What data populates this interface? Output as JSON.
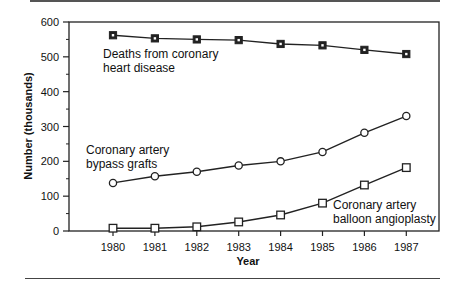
{
  "chart_data": {
    "type": "line",
    "title": "",
    "xlabel": "Year",
    "ylabel": "Number (thousands)",
    "ylim": [
      0,
      600
    ],
    "yticks": [
      0,
      100,
      200,
      300,
      400,
      500,
      600
    ],
    "x": [
      1980,
      1981,
      1982,
      1983,
      1984,
      1985,
      1986,
      1987
    ],
    "grid": false,
    "legend_position": "inline annotations",
    "series": [
      {
        "name": "Deaths from coronary heart disease",
        "marker": "filled-square",
        "values": [
          562,
          553,
          550,
          548,
          537,
          533,
          520,
          508
        ]
      },
      {
        "name": "Coronary artery bypass grafts",
        "marker": "open-circle",
        "values": [
          138,
          157,
          170,
          188,
          200,
          227,
          282,
          330
        ]
      },
      {
        "name": "Coronary artery balloon angioplasty",
        "marker": "open-square",
        "values": [
          8,
          8,
          12,
          26,
          46,
          80,
          132,
          182
        ]
      }
    ],
    "annotations": [
      {
        "lines": [
          "Deaths from coronary",
          "heart disease"
        ]
      },
      {
        "lines": [
          "Coronary artery",
          "bypass grafts"
        ]
      },
      {
        "lines": [
          "Coronary artery",
          "balloon angioplasty"
        ]
      }
    ]
  },
  "axes": {
    "x_title": "Year",
    "y_title": "Number (thousands)",
    "x_ticks": [
      "1980",
      "1981",
      "1982",
      "1983",
      "1984",
      "1985",
      "1986",
      "1987"
    ],
    "y_ticks": [
      "0",
      "100",
      "200",
      "300",
      "400",
      "500",
      "600"
    ]
  },
  "labels": {
    "deaths_line1": "Deaths from coronary",
    "deaths_line2": "heart disease",
    "bypass_line1": "Coronary artery",
    "bypass_line2": "bypass grafts",
    "balloon_line1": "Coronary artery",
    "balloon_line2": "balloon angioplasty"
  },
  "colors": {
    "ink": "#111111",
    "frame": "#222222"
  }
}
